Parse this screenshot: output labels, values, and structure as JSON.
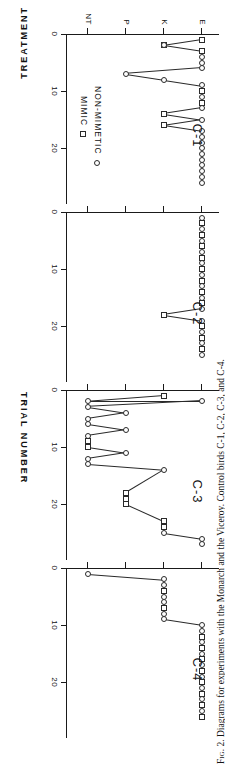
{
  "figure": {
    "caption_label": "Fig. 2.",
    "caption_text": "Diagrams for experiments with the Monarch and the Viceroy.  Control birds C-1, C-2, C-3, and C-4.",
    "x_axis_title": "TRIAL  NUMBER",
    "y_axis_title": "TREATMENT",
    "legend": [
      {
        "label": "NON-MIMETIC",
        "marker": "circle"
      },
      {
        "label": "MIMIC",
        "marker": "square"
      }
    ],
    "y_categories": [
      "E",
      "K",
      "P",
      "NT"
    ],
    "x_ticks": [
      "0",
      "10",
      "20"
    ],
    "x_tick_values": [
      0,
      10,
      20
    ]
  },
  "chart_data": {
    "type": "scatter",
    "title": "Diagrams for experiments with the Monarch and the Viceroy. Control birds C-1, C-2, C-3, and C-4.",
    "xlabel": "TRIAL NUMBER",
    "ylabel": "TREATMENT",
    "xlim": [
      0,
      28
    ],
    "ylim_categories": [
      "NT",
      "P",
      "K",
      "E"
    ],
    "grid": false,
    "legend_position": "inside-lower-right",
    "panels": [
      {
        "name": "C-1",
        "points": [
          {
            "trial": 1,
            "treatment": "E",
            "marker": "circle"
          },
          {
            "trial": 1,
            "treatment": "E",
            "marker": "square"
          },
          {
            "trial": 2,
            "treatment": "K",
            "marker": "square"
          },
          {
            "trial": 2,
            "treatment": "K",
            "marker": "circle"
          },
          {
            "trial": 3,
            "treatment": "E",
            "marker": "circle"
          },
          {
            "trial": 3,
            "treatment": "E",
            "marker": "square"
          },
          {
            "trial": 4,
            "treatment": "E",
            "marker": "circle"
          },
          {
            "trial": 5,
            "treatment": "E",
            "marker": "circle"
          },
          {
            "trial": 6,
            "treatment": "E",
            "marker": "circle"
          },
          {
            "trial": 7,
            "treatment": "P",
            "marker": "circle"
          },
          {
            "trial": 8,
            "treatment": "K",
            "marker": "circle"
          },
          {
            "trial": 9,
            "treatment": "E",
            "marker": "circle"
          },
          {
            "trial": 10,
            "treatment": "E",
            "marker": "square"
          },
          {
            "trial": 11,
            "treatment": "E",
            "marker": "circle"
          },
          {
            "trial": 12,
            "treatment": "E",
            "marker": "square"
          },
          {
            "trial": 13,
            "treatment": "E",
            "marker": "circle"
          },
          {
            "trial": 14,
            "treatment": "K",
            "marker": "square"
          },
          {
            "trial": 15,
            "treatment": "E",
            "marker": "circle"
          },
          {
            "trial": 16,
            "treatment": "K",
            "marker": "square"
          },
          {
            "trial": 17,
            "treatment": "E",
            "marker": "circle"
          },
          {
            "trial": 18,
            "treatment": "E",
            "marker": "circle"
          },
          {
            "trial": 19,
            "treatment": "E",
            "marker": "circle"
          },
          {
            "trial": 20,
            "treatment": "E",
            "marker": "circle"
          },
          {
            "trial": 21,
            "treatment": "E",
            "marker": "circle"
          },
          {
            "trial": 22,
            "treatment": "E",
            "marker": "circle"
          },
          {
            "trial": 23,
            "treatment": "E",
            "marker": "circle"
          },
          {
            "trial": 24,
            "treatment": "E",
            "marker": "circle"
          },
          {
            "trial": 25,
            "treatment": "E",
            "marker": "circle"
          },
          {
            "trial": 26,
            "treatment": "E",
            "marker": "circle"
          }
        ]
      },
      {
        "name": "C-2",
        "points": [
          {
            "trial": 1,
            "treatment": "E",
            "marker": "circle"
          },
          {
            "trial": 2,
            "treatment": "E",
            "marker": "square"
          },
          {
            "trial": 3,
            "treatment": "E",
            "marker": "circle"
          },
          {
            "trial": 4,
            "treatment": "E",
            "marker": "square"
          },
          {
            "trial": 5,
            "treatment": "E",
            "marker": "circle"
          },
          {
            "trial": 6,
            "treatment": "E",
            "marker": "square"
          },
          {
            "trial": 7,
            "treatment": "E",
            "marker": "circle"
          },
          {
            "trial": 8,
            "treatment": "E",
            "marker": "square"
          },
          {
            "trial": 9,
            "treatment": "E",
            "marker": "circle"
          },
          {
            "trial": 10,
            "treatment": "E",
            "marker": "square"
          },
          {
            "trial": 11,
            "treatment": "E",
            "marker": "circle"
          },
          {
            "trial": 12,
            "treatment": "E",
            "marker": "square"
          },
          {
            "trial": 13,
            "treatment": "E",
            "marker": "circle"
          },
          {
            "trial": 14,
            "treatment": "E",
            "marker": "square"
          },
          {
            "trial": 15,
            "treatment": "E",
            "marker": "circle"
          },
          {
            "trial": 16,
            "treatment": "E",
            "marker": "square"
          },
          {
            "trial": 17,
            "treatment": "E",
            "marker": "circle"
          },
          {
            "trial": 18,
            "treatment": "K",
            "marker": "square"
          },
          {
            "trial": 19,
            "treatment": "E",
            "marker": "circle"
          },
          {
            "trial": 20,
            "treatment": "E",
            "marker": "square"
          },
          {
            "trial": 21,
            "treatment": "E",
            "marker": "circle"
          },
          {
            "trial": 22,
            "treatment": "E",
            "marker": "square"
          },
          {
            "trial": 23,
            "treatment": "E",
            "marker": "circle"
          },
          {
            "trial": 24,
            "treatment": "E",
            "marker": "square"
          },
          {
            "trial": 25,
            "treatment": "E",
            "marker": "circle"
          }
        ]
      },
      {
        "name": "C-3",
        "points": [
          {
            "trial": 1,
            "treatment": "K",
            "marker": "square"
          },
          {
            "trial": 2,
            "treatment": "NT",
            "marker": "circle"
          },
          {
            "trial": 3,
            "treatment": "NT",
            "marker": "circle"
          },
          {
            "trial": 4,
            "treatment": "P",
            "marker": "circle"
          },
          {
            "trial": 5,
            "treatment": "NT",
            "marker": "circle"
          },
          {
            "trial": 6,
            "treatment": "NT",
            "marker": "circle"
          },
          {
            "trial": 7,
            "treatment": "P",
            "marker": "circle"
          },
          {
            "trial": 8,
            "treatment": "NT",
            "marker": "circle"
          },
          {
            "trial": 9,
            "treatment": "NT",
            "marker": "square"
          },
          {
            "trial": 10,
            "treatment": "NT",
            "marker": "square"
          },
          {
            "trial": 11,
            "treatment": "P",
            "marker": "circle"
          },
          {
            "trial": 12,
            "treatment": "NT",
            "marker": "circle"
          },
          {
            "trial": 13,
            "treatment": "NT",
            "marker": "circle"
          },
          {
            "trial": 14,
            "treatment": "K",
            "marker": "circle"
          },
          {
            "trial": 18,
            "treatment": "P",
            "marker": "square"
          },
          {
            "trial": 19,
            "treatment": "P",
            "marker": "square"
          },
          {
            "trial": 20,
            "treatment": "P",
            "marker": "square"
          },
          {
            "trial": 23,
            "treatment": "K",
            "marker": "square"
          },
          {
            "trial": 24,
            "treatment": "K",
            "marker": "square"
          },
          {
            "trial": 25,
            "treatment": "K",
            "marker": "circle"
          },
          {
            "trial": 26,
            "treatment": "E",
            "marker": "circle"
          },
          {
            "trial": 2,
            "treatment": "E",
            "marker": "circle"
          },
          {
            "trial": 27,
            "treatment": "E",
            "marker": "circle"
          }
        ]
      },
      {
        "name": "C-4",
        "points": [
          {
            "trial": 1,
            "treatment": "NT",
            "marker": "circle"
          },
          {
            "trial": 2,
            "treatment": "K",
            "marker": "circle"
          },
          {
            "trial": 3,
            "treatment": "K",
            "marker": "circle"
          },
          {
            "trial": 4,
            "treatment": "K",
            "marker": "square"
          },
          {
            "trial": 5,
            "treatment": "K",
            "marker": "circle"
          },
          {
            "trial": 6,
            "treatment": "K",
            "marker": "circle"
          },
          {
            "trial": 7,
            "treatment": "K",
            "marker": "square"
          },
          {
            "trial": 8,
            "treatment": "K",
            "marker": "circle"
          },
          {
            "trial": 9,
            "treatment": "K",
            "marker": "circle"
          },
          {
            "trial": 10,
            "treatment": "E",
            "marker": "circle"
          },
          {
            "trial": 11,
            "treatment": "E",
            "marker": "circle"
          },
          {
            "trial": 12,
            "treatment": "E",
            "marker": "square"
          },
          {
            "trial": 13,
            "treatment": "E",
            "marker": "circle"
          },
          {
            "trial": 14,
            "treatment": "E",
            "marker": "square"
          },
          {
            "trial": 15,
            "treatment": "E",
            "marker": "circle"
          },
          {
            "trial": 16,
            "treatment": "E",
            "marker": "square"
          },
          {
            "trial": 17,
            "treatment": "E",
            "marker": "circle"
          },
          {
            "trial": 18,
            "treatment": "E",
            "marker": "square"
          },
          {
            "trial": 19,
            "treatment": "E",
            "marker": "circle"
          },
          {
            "trial": 20,
            "treatment": "E",
            "marker": "square"
          },
          {
            "trial": 21,
            "treatment": "E",
            "marker": "circle"
          },
          {
            "trial": 22,
            "treatment": "E",
            "marker": "square"
          },
          {
            "trial": 23,
            "treatment": "E",
            "marker": "circle"
          },
          {
            "trial": 24,
            "treatment": "E",
            "marker": "square"
          },
          {
            "trial": 25,
            "treatment": "E",
            "marker": "circle"
          },
          {
            "trial": 26,
            "treatment": "E",
            "marker": "square"
          }
        ]
      }
    ]
  }
}
